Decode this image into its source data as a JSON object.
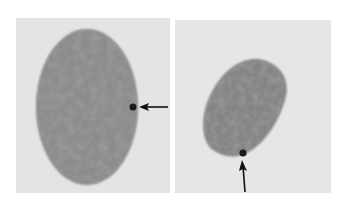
{
  "figure": {
    "panels": [
      {
        "id": "left",
        "subject": "oval cell nucleus with mottled chromatin",
        "marker": {
          "type": "arrow",
          "direction": "left",
          "points_to": "dark spot on right edge of nucleus"
        }
      },
      {
        "id": "right",
        "subject": "smaller tilted oval cell nucleus with mottled chromatin",
        "marker": {
          "type": "arrow",
          "direction": "up",
          "points_to": "dark spot on bottom edge of nucleus"
        }
      }
    ],
    "colors": {
      "background": "#ffffff",
      "panel_bg": "#e4e4e4",
      "nucleus": "#8a8a8a",
      "chromatin_dark": "#5a5a5a",
      "spot": "#1a1a1a",
      "arrow": "#111111"
    }
  }
}
